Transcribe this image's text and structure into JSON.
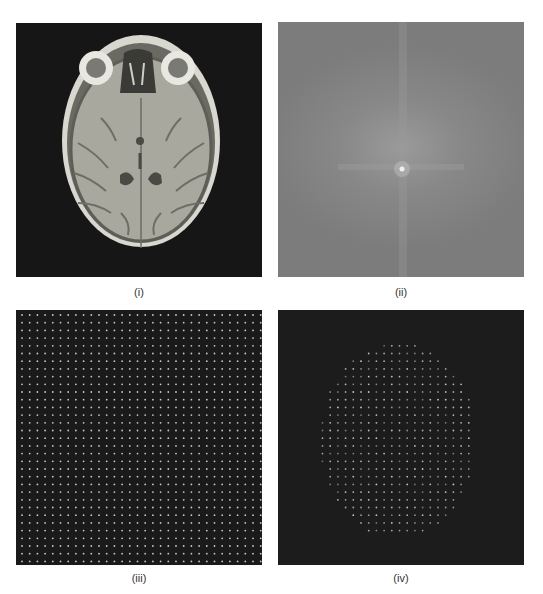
{
  "figure": {
    "panels": [
      {
        "id": "i",
        "caption": "(i)",
        "content": "MRI axial brain slice (T1-weighted), grayscale"
      },
      {
        "id": "ii",
        "caption": "(ii)",
        "content": "2D Fourier magnitude spectrum (k-space), bright centre with cross-shaped streaks"
      },
      {
        "id": "iii",
        "caption": "(iii)",
        "content": "Uniform grid of sample points on dark background"
      },
      {
        "id": "iv",
        "caption": "(iv)",
        "content": "Sample points masked to head-shaped region on dark background"
      }
    ],
    "colors": {
      "background": "#ffffff",
      "panel_dark": "#181818",
      "spectrum_gray": "#858585",
      "dot": "#c8c8c8",
      "caption_text": "#333333"
    },
    "grid": {
      "spacing_px": 7.7,
      "columns": 32,
      "rows": 33
    }
  }
}
